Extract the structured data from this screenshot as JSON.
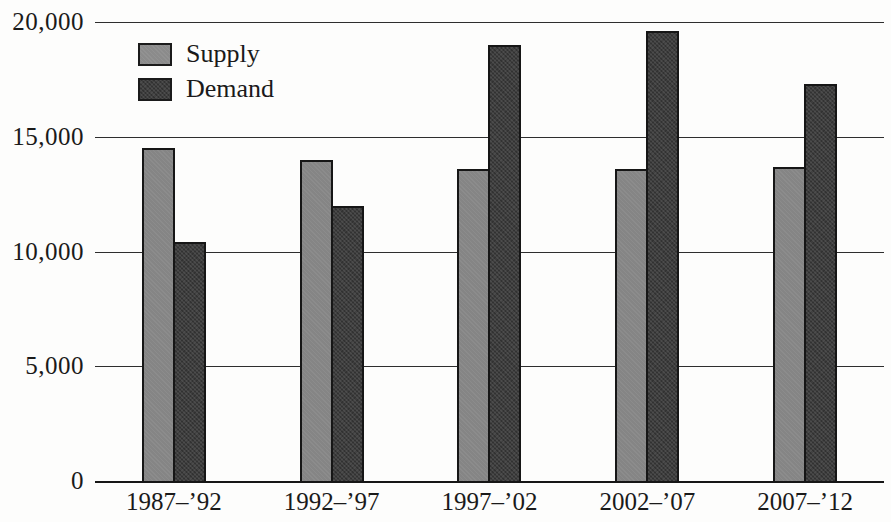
{
  "figure": {
    "background_color": "#fdfdfc",
    "text_color": "#1a1a1a"
  },
  "chart_data": {
    "type": "bar",
    "title": "",
    "xlabel": "",
    "ylabel": "",
    "categories": [
      "1987–’92",
      "1992–’97",
      "1997–’02",
      "2002–’07",
      "2007–’12"
    ],
    "series": [
      {
        "name": "Supply",
        "color": "#858585",
        "values": [
          14500,
          14000,
          13600,
          13600,
          13700
        ]
      },
      {
        "name": "Demand",
        "color": "#3d3d3d",
        "values": [
          10400,
          12000,
          19000,
          19600,
          17300
        ]
      }
    ],
    "ylim": [
      0,
      20000
    ],
    "yticks": [
      0,
      5000,
      10000,
      15000,
      20000
    ],
    "ytick_labels": [
      "0",
      "5,000",
      "10,000",
      "15,000",
      "20,000"
    ],
    "grid": true,
    "gridline_color": "#2e2e2e",
    "legend_position": "upper-left",
    "legend_entries": [
      "Supply",
      "Demand"
    ]
  }
}
